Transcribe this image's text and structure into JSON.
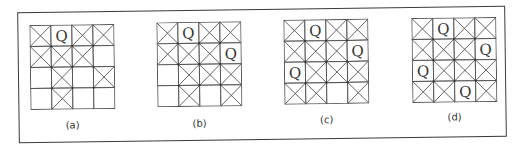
{
  "diagram": {
    "colors": {
      "line": "#555555",
      "text": "#333333",
      "frame": "#3a3a3a"
    },
    "cell_legend": {
      "Q": "queen",
      "X": "attacked/blocked cell",
      "": "empty cell"
    },
    "panels": [
      {
        "label": "(a)",
        "grid": [
          [
            "X",
            "Q",
            "X",
            "X"
          ],
          [
            "X",
            "X",
            "X",
            ""
          ],
          [
            "",
            "X",
            "",
            "X"
          ],
          [
            "",
            "X",
            "",
            ""
          ]
        ]
      },
      {
        "label": "(b)",
        "grid": [
          [
            "X",
            "Q",
            "X",
            "X"
          ],
          [
            "X",
            "X",
            "X",
            "Q"
          ],
          [
            "",
            "X",
            "X",
            "X"
          ],
          [
            "",
            "X",
            "",
            "X"
          ]
        ]
      },
      {
        "label": "(c)",
        "grid": [
          [
            "X",
            "Q",
            "X",
            "X"
          ],
          [
            "X",
            "X",
            "X",
            "Q"
          ],
          [
            "Q",
            "X",
            "X",
            "X"
          ],
          [
            "X",
            "X",
            "",
            "X"
          ]
        ]
      },
      {
        "label": "(d)",
        "grid": [
          [
            "X",
            "Q",
            "X",
            "X"
          ],
          [
            "X",
            "X",
            "X",
            "Q"
          ],
          [
            "Q",
            "X",
            "X",
            "X"
          ],
          [
            "X",
            "X",
            "Q",
            "X"
          ]
        ]
      }
    ]
  }
}
